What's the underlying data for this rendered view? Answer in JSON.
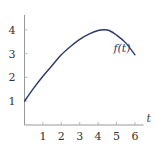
{
  "chart_data": {
    "type": "line",
    "title": "",
    "xlabel": "t",
    "ylabel": "",
    "xlim": [
      0,
      6.3
    ],
    "ylim": [
      0,
      4.5
    ],
    "x_ticks": [
      1,
      2,
      3,
      4,
      5,
      6
    ],
    "y_ticks": [
      1,
      2,
      3,
      4
    ],
    "x_tick_labels": [
      "1",
      "2",
      "3",
      "4",
      "5",
      "6"
    ],
    "y_tick_labels": [
      "1",
      "2",
      "3",
      "4"
    ],
    "grid": false,
    "series": [
      {
        "name": "f(t)",
        "label": "f(t)",
        "color": "#2a3a66",
        "x": [
          0,
          0.5,
          1,
          1.5,
          2,
          2.5,
          3,
          3.5,
          4,
          4.3,
          4.6,
          5,
          5.5,
          6
        ],
        "y": [
          1,
          1.55,
          2.05,
          2.5,
          2.95,
          3.3,
          3.6,
          3.82,
          3.97,
          4.0,
          3.97,
          3.78,
          3.45,
          2.95
        ]
      }
    ],
    "annotations": [
      {
        "text": "f(t)",
        "x": 5.3,
        "y": 3.05
      }
    ]
  }
}
